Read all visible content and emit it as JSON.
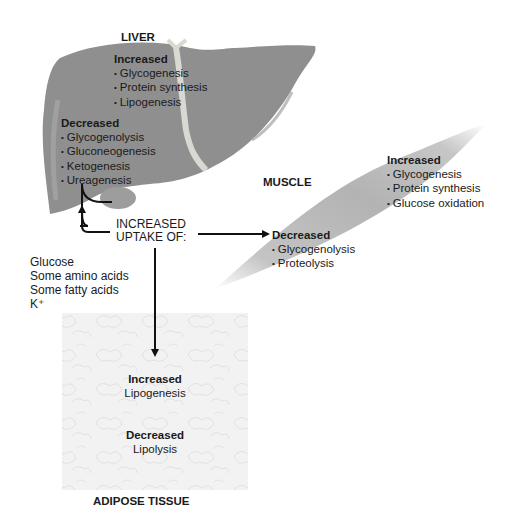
{
  "liver": {
    "title": "LIVER",
    "increased_label": "Increased",
    "increased": [
      "Glycogenesis",
      "Protein synthesis",
      "Lipogenesis"
    ],
    "decreased_label": "Decreased",
    "decreased": [
      "Glycogenolysis",
      "Gluconeogenesis",
      "Ketogenesis",
      "Ureagenesis"
    ],
    "color": "#8f8f8f"
  },
  "muscle": {
    "title": "MUSCLE",
    "increased_label": "Increased",
    "increased": [
      "Glycogenesis",
      "Protein synthesis",
      "Glucose oxidation"
    ],
    "decreased_label": "Decreased",
    "decreased": [
      "Glycogenolysis",
      "Proteolysis"
    ],
    "color": "#b5b5b5"
  },
  "adipose": {
    "title": "ADIPOSE TISSUE",
    "increased_label": "Increased",
    "increased_item": "Lipogenesis",
    "decreased_label": "Decreased",
    "decreased_item": "Lipolysis",
    "color": "#f2f2f2"
  },
  "uptake": {
    "line1": "INCREASED",
    "line2": "UPTAKE OF:",
    "substances": [
      "Glucose",
      "Some amino acids",
      "Some fatty acids",
      "K⁺"
    ]
  }
}
